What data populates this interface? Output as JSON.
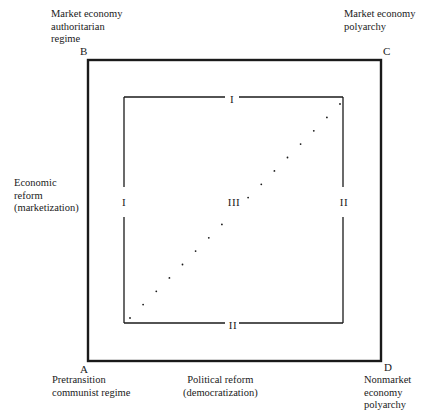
{
  "diagram": {
    "corners": {
      "A": {
        "letter": "A",
        "label": "Pretransition\ncommunist regime"
      },
      "B": {
        "letter": "B",
        "label": "Market economy\nauthoritarian\nregime"
      },
      "C": {
        "letter": "C",
        "label": "Market economy\npolyarchy"
      },
      "D": {
        "letter": "D",
        "label": "Nonmarket\neconomy\npolyarchy"
      }
    },
    "axes": {
      "vertical": "Economic\nreform\n(marketization)",
      "horizontal": "Political reform\n(democratization)"
    },
    "regions": {
      "top": "I",
      "left": "I",
      "right": "II",
      "bottom": "II",
      "center": "III"
    },
    "diagonal_dots": 17,
    "colors": {
      "line": "#1a1a1a",
      "background": "#ffffff"
    }
  }
}
